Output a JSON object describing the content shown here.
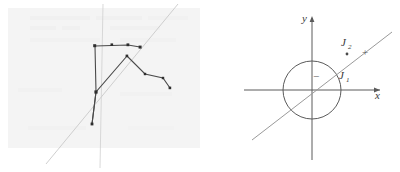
{
  "figure": {
    "background_color": "#ffffff",
    "panels": [
      {
        "id": "left-panel",
        "name": "scanned-plot-panel",
        "description": "Faint scanned graph paper with a dark polyline trace",
        "paper_tint": "#f2f2f2",
        "ink_color": "#4a4a4a",
        "faint_line_color": "#c9c9c9",
        "axis_lines": [
          {
            "name": "vertical-guide",
            "x1": 103,
            "y1": 4,
            "x2": 100,
            "y2": 168
          },
          {
            "name": "diagonal-guide",
            "x1": 46,
            "y1": 164,
            "x2": 178,
            "y2": 4
          }
        ],
        "polyline_points": "95,46 128,45 140,47 127,56 145,74 163,78 170,88",
        "trace_segments": [
          {
            "name": "top-horizontal",
            "points": "95,46 128,45 140,47"
          },
          {
            "name": "left-vertical",
            "points": "95,46 96,92 92,124"
          },
          {
            "name": "rising-diagonal",
            "points": "92,124 96,92 127,56"
          },
          {
            "name": "falling-diagonal",
            "points": "127,56 145,74 163,78 170,88"
          }
        ],
        "markers": [
          {
            "name": "data-point",
            "cx": 95,
            "cy": 46
          },
          {
            "name": "data-point",
            "cx": 112,
            "cy": 45
          },
          {
            "name": "data-point",
            "cx": 128,
            "cy": 45
          },
          {
            "name": "data-point",
            "cx": 140,
            "cy": 47
          },
          {
            "name": "data-point",
            "cx": 127,
            "cy": 56
          },
          {
            "name": "data-point",
            "cx": 145,
            "cy": 74
          },
          {
            "name": "data-point",
            "cx": 163,
            "cy": 78
          },
          {
            "name": "data-point",
            "cx": 170,
            "cy": 88
          },
          {
            "name": "data-point",
            "cx": 96,
            "cy": 92
          },
          {
            "name": "data-point",
            "cx": 92,
            "cy": 124
          }
        ]
      },
      {
        "id": "right-panel",
        "name": "unit-circle-diagram",
        "description": "Cartesian axes with a circle centred at the origin and a straight line crossing it",
        "ink_color": "#555555",
        "circle": {
          "cx": 104,
          "cy": 90,
          "r": 29
        },
        "axes": {
          "x_axis": {
            "x1": 36,
            "y1": 90,
            "x2": 176,
            "y2": 90
          },
          "y_axis": {
            "x1": 104,
            "y1": 14,
            "x2": 104,
            "y2": 164
          }
        },
        "line": {
          "x1": 44,
          "y1": 140,
          "x2": 184,
          "y2": 32
        },
        "line_point": {
          "cx": 139,
          "cy": 54
        },
        "labels": {
          "x_axis": "x",
          "y_axis": "y",
          "j1": "J",
          "j1_sub": "1",
          "j2": "J",
          "j2_sub": "2",
          "plus": "+",
          "minus": "−"
        },
        "label_positions": {
          "x_axis": {
            "x": 172,
            "y": 98
          },
          "y_axis": {
            "x": 96,
            "y": 22
          },
          "j1": {
            "x": 133,
            "y": 78
          },
          "j2": {
            "x": 135,
            "y": 47
          },
          "plus": {
            "x": 157,
            "y": 53
          },
          "minus": {
            "x": 108,
            "y": 77
          }
        }
      }
    ]
  }
}
